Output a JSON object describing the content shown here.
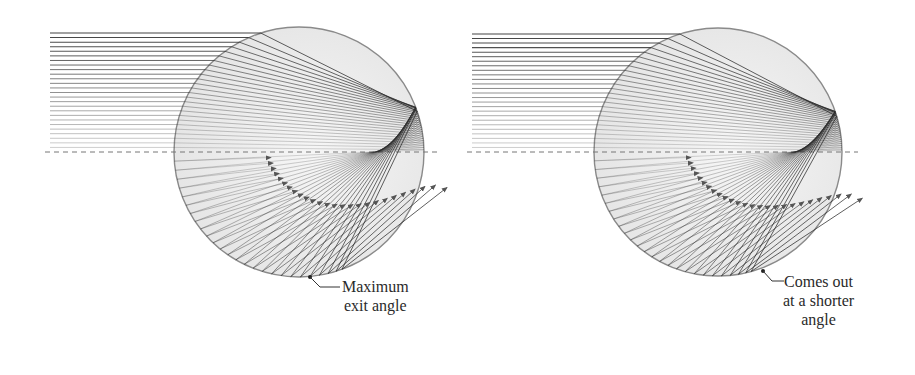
{
  "diagram": {
    "type": "raindrop-ray-tracing",
    "panels": [
      {
        "id": "left",
        "circle": {
          "cx": 299,
          "cy": 152,
          "r": 125
        },
        "axis": {
          "x1": 45,
          "x2": 440,
          "y": 152
        },
        "ray_start_x": 50,
        "ray_count": 26,
        "ray_top_y": 33,
        "refractive_index": 1.333,
        "callout": {
          "point": [
            310,
            277
          ],
          "elbow": [
            320,
            287
          ],
          "end": [
            340,
            287
          ],
          "lines": [
            "Maximum",
            "exit angle"
          ],
          "label_x": 342,
          "label_y": 277
        }
      },
      {
        "id": "right",
        "circle": {
          "cx": 718,
          "cy": 152,
          "r": 124
        },
        "axis": {
          "x1": 467,
          "x2": 858,
          "y": 152
        },
        "ray_start_x": 472,
        "ray_count": 26,
        "ray_top_y": 34,
        "refractive_index": 1.36,
        "callout": {
          "point": [
            763,
            271
          ],
          "elbow": [
            772,
            281
          ],
          "end": [
            784,
            281
          ],
          "lines": [
            "Comes out",
            "at a shorter",
            "angle"
          ],
          "label_x": 783,
          "label_y": 272
        }
      }
    ],
    "colors": {
      "circle_stroke": "#8a8a8a",
      "circle_fill": "#ececec",
      "ray": "#3a3a3a",
      "axis": "#777777",
      "text": "#2a2a2a"
    }
  },
  "labels": {
    "left": [
      "Maximum",
      "exit angle"
    ],
    "right": [
      "Comes out",
      "at a shorter",
      "angle"
    ]
  }
}
